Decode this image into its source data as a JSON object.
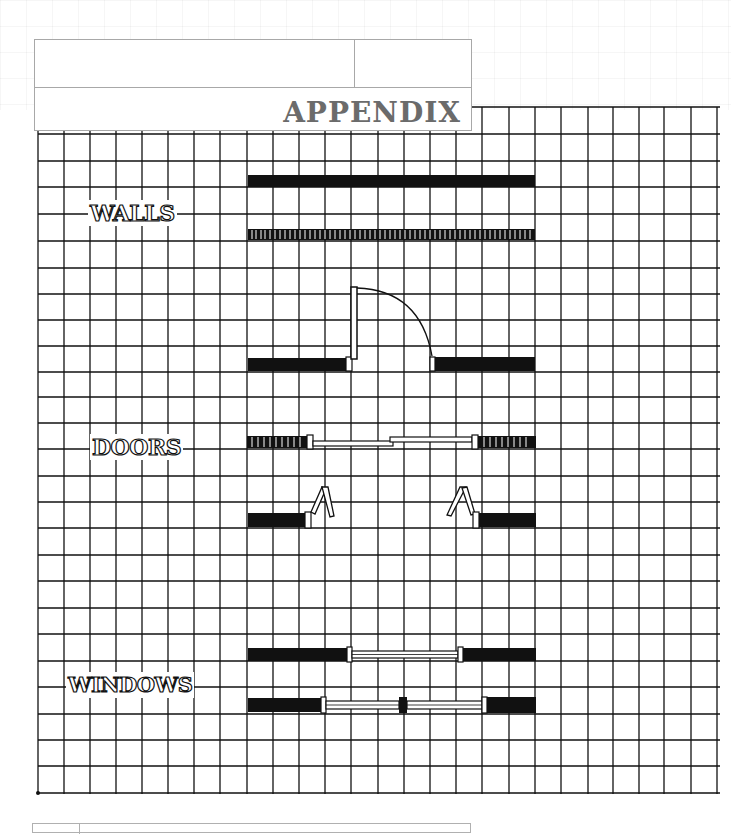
{
  "title_block": {
    "cell_top_left": "",
    "cell_top_right": "",
    "heading": "APPENDIX"
  },
  "legend": {
    "sections": [
      {
        "id": "walls",
        "label": "WALLS",
        "symbols": [
          "solid-wall",
          "hatched-wall"
        ]
      },
      {
        "id": "doors",
        "label": "DOORS",
        "symbols": [
          "swing-door",
          "sliding-door",
          "bifold-door"
        ]
      },
      {
        "id": "windows",
        "label": "WINDOWS",
        "symbols": [
          "single-window",
          "double-window"
        ]
      }
    ]
  },
  "grid": {
    "cell_size_px": 26,
    "line_color": "#111111",
    "fill_color": "#111111"
  },
  "bottom_block": {
    "cell_left": "",
    "cell_right": ""
  }
}
